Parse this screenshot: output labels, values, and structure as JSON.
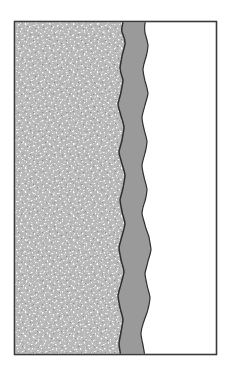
{
  "figure": {
    "type": "cross-section-diagram",
    "title": "",
    "caption": "",
    "width": 232,
    "height": 366,
    "background_color": "#ffffff",
    "frame": {
      "x": 14.5,
      "y": 21.5,
      "width": 202,
      "height": 333,
      "stroke_color": "#3a3a3a",
      "stroke_width": 1.6,
      "fill": "none"
    },
    "layers": [
      {
        "id": "layer-substrate",
        "name": "stippled-substrate-layer",
        "order": 1,
        "position": "left",
        "fill_style": "stipple",
        "base_color": "#b9b9b9",
        "speckle_color": "#ffffff",
        "speckle_dark_color": "#8e8e8e",
        "x_start": 15,
        "x_end": 122,
        "nominal_width_px": 107,
        "outline_color": "#2e2e2e",
        "outline_width": 1.5,
        "boundary_type": "wavy",
        "description": "Coarse stippled granular texture occupying the left portion of the frame"
      },
      {
        "id": "layer-interface",
        "name": "solid-gray-interface-band",
        "order": 2,
        "position": "middle",
        "fill_style": "solid",
        "base_color": "#9a9a9a",
        "x_start": 118,
        "x_end": 150,
        "nominal_width_px": 30,
        "outline_color": "#2e2e2e",
        "outline_width": 1.4,
        "boundary_type": "wavy",
        "description": "Solid mid-gray vertical band with undulating left and right boundaries"
      },
      {
        "id": "layer-void",
        "name": "white-region-layer",
        "order": 3,
        "position": "right",
        "fill_style": "solid",
        "base_color": "#ffffff",
        "x_start": 150,
        "x_end": 216,
        "nominal_width_px": 66,
        "outline_color": "none",
        "outline_width": 0,
        "boundary_type": "straight",
        "description": "Empty white region occupying the right portion of the frame"
      }
    ],
    "boundaries": {
      "left_interface": {
        "name": "substrate-to-band-boundary",
        "orientation": "vertical",
        "mean_x": 121,
        "amplitude_px": 4.5,
        "points": [
          [
            124,
            21
          ],
          [
            122,
            32
          ],
          [
            125,
            44
          ],
          [
            122,
            56
          ],
          [
            120,
            68
          ],
          [
            123,
            80
          ],
          [
            121,
            92
          ],
          [
            118,
            104
          ],
          [
            121,
            116
          ],
          [
            124,
            128
          ],
          [
            122,
            140
          ],
          [
            119,
            152
          ],
          [
            122,
            164
          ],
          [
            125,
            176
          ],
          [
            123,
            188
          ],
          [
            120,
            200
          ],
          [
            122,
            212
          ],
          [
            125,
            224
          ],
          [
            122,
            236
          ],
          [
            119,
            248
          ],
          [
            121,
            260
          ],
          [
            124,
            272
          ],
          [
            121,
            284
          ],
          [
            118,
            296
          ],
          [
            120,
            308
          ],
          [
            123,
            320
          ],
          [
            121,
            332
          ],
          [
            119,
            344
          ],
          [
            121,
            355
          ]
        ]
      },
      "right_interface": {
        "name": "band-to-white-boundary",
        "orientation": "vertical",
        "mean_x": 146,
        "amplitude_px": 5.5,
        "points": [
          [
            147,
            21
          ],
          [
            145,
            33
          ],
          [
            148,
            45
          ],
          [
            146,
            57
          ],
          [
            143,
            69
          ],
          [
            145,
            81
          ],
          [
            148,
            93
          ],
          [
            145,
            105
          ],
          [
            142,
            117
          ],
          [
            144,
            129
          ],
          [
            147,
            141
          ],
          [
            145,
            153
          ],
          [
            142,
            165
          ],
          [
            144,
            177
          ],
          [
            147,
            189
          ],
          [
            145,
            201
          ],
          [
            142,
            213
          ],
          [
            145,
            225
          ],
          [
            149,
            237
          ],
          [
            151,
            249
          ],
          [
            148,
            261
          ],
          [
            145,
            273
          ],
          [
            147,
            285
          ],
          [
            150,
            297
          ],
          [
            148,
            309
          ],
          [
            144,
            321
          ],
          [
            141,
            333
          ],
          [
            143,
            345
          ],
          [
            145,
            355
          ]
        ]
      }
    },
    "colors": {
      "frame_stroke": "#3a3a3a",
      "substrate_base": "#b9b9b9",
      "substrate_speckle_light": "#ffffff",
      "substrate_speckle_dark": "#8e8e8e",
      "interface_band": "#9a9a9a",
      "boundary_stroke": "#2e2e2e",
      "void_fill": "#ffffff",
      "page_background": "#ffffff"
    },
    "annotations": [],
    "labels": [],
    "scale_bar": null,
    "legend": null
  }
}
